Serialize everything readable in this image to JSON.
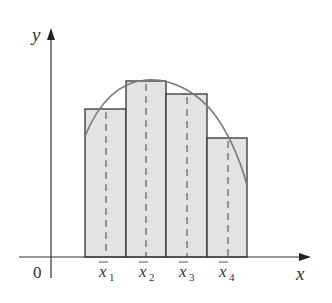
{
  "diagram": {
    "axes": {
      "x_label": "x",
      "y_label": "y",
      "origin_label": "0"
    },
    "sample_points": [
      {
        "name": "x1",
        "base": "x",
        "sub": "1"
      },
      {
        "name": "x2",
        "base": "x",
        "sub": "2"
      },
      {
        "name": "x3",
        "base": "x",
        "sub": "3"
      },
      {
        "name": "x4",
        "base": "x",
        "sub": "4"
      }
    ],
    "rectangles": [
      {
        "left": 85,
        "right": 126,
        "top": 109
      },
      {
        "left": 126,
        "right": 166,
        "top": 81
      },
      {
        "left": 166,
        "right": 207,
        "top": 94
      },
      {
        "left": 207,
        "right": 247,
        "top": 138
      }
    ],
    "colors": {
      "rect_fill": "#e3e3e3",
      "rect_stroke": "#333333",
      "curve": "#7a7a7a",
      "axis": "#333333"
    }
  }
}
